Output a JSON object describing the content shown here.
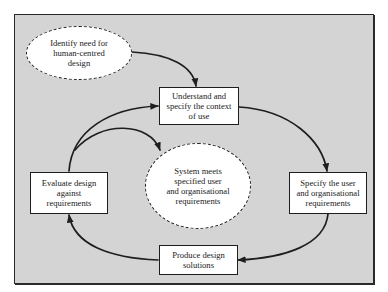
{
  "diagram": {
    "title": "",
    "style": {
      "background": "#d4d4d4",
      "frame_border": "#2a2a2a",
      "node_fill": "#ffffff",
      "stroke": "#1e1e1e"
    },
    "nodes": {
      "identify_need": {
        "shape": "ellipse",
        "label": "Identify need for\nhuman-centred\ndesign"
      },
      "understand_context": {
        "shape": "rectangle",
        "label": "Understand and\nspecify the context\nof use"
      },
      "specify_requirements": {
        "shape": "rectangle",
        "label": "Specify the user\nand organisational\nrequirements"
      },
      "produce_design": {
        "shape": "rectangle",
        "label": "Produce design\nsolutions"
      },
      "evaluate_design": {
        "shape": "rectangle",
        "label": "Evaluate design\nagainst\nrequirements"
      },
      "system_meets": {
        "shape": "ellipse",
        "label": "System meets\nspecified user\nand organisational\nrequirements"
      }
    },
    "edges": [
      {
        "from": "identify_need",
        "to": "understand_context"
      },
      {
        "from": "understand_context",
        "to": "specify_requirements"
      },
      {
        "from": "specify_requirements",
        "to": "produce_design"
      },
      {
        "from": "produce_design",
        "to": "evaluate_design"
      },
      {
        "from": "evaluate_design",
        "to": "understand_context"
      },
      {
        "from": "evaluate_design",
        "to": "system_meets"
      }
    ]
  }
}
